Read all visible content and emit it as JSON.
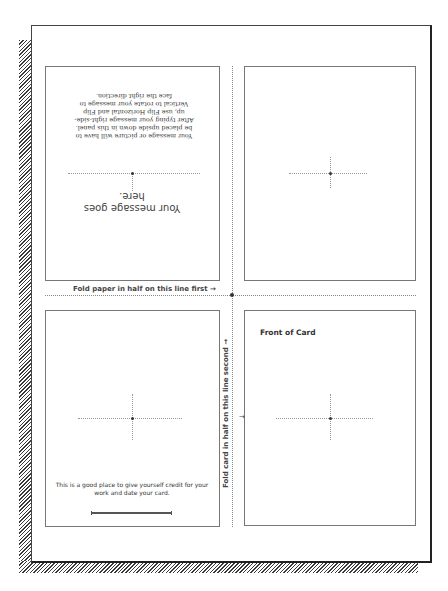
{
  "document": {
    "type": "greeting card print layout",
    "fold_first_label": "Fold paper in half on this line first →",
    "fold_second_label": "Fold card in half on this line second →",
    "fold_second_arrow": "→"
  },
  "panels": {
    "top_left": {
      "orientation": "upside-down",
      "message": "Your message goes here.",
      "instructions": "Your message or picture will have to be placed upside down in this panel. After typing your message right-side-up, use Flip Horizontal and Flip Vertical to rotate your message to face the right direction."
    },
    "top_right": {
      "content": ""
    },
    "bottom_left": {
      "credit_text": "This is a good place to give yourself credit for your work and date your card.",
      "signature_line": true
    },
    "bottom_right": {
      "title": "Front of Card"
    }
  },
  "colors": {
    "border": "#444444",
    "panel_border": "#777777",
    "text": "#333333",
    "shadow_hatch": "#3a3a3a"
  }
}
